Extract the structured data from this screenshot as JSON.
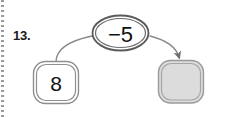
{
  "item": {
    "number_label": "13."
  },
  "diagram": {
    "type": "number-machine-flow",
    "operator_node": {
      "label": "−5",
      "shape": "ellipse",
      "fill": "#ffffff",
      "stroke": "#555555"
    },
    "start_node": {
      "label": "8",
      "shape": "rounded-square",
      "fill": "#ffffff",
      "stroke": "#7a7a7a"
    },
    "answer_node": {
      "label": "",
      "shape": "rounded-square",
      "fill": "#dcdcdc",
      "stroke": "#8a8a8a",
      "is_blank": true
    },
    "connectors": [
      {
        "name": "input-curve",
        "from": "start_node",
        "to": "operator_node",
        "arrowhead": false
      },
      {
        "name": "output-arrow",
        "from": "operator_node",
        "to": "answer_node",
        "arrowhead": true
      }
    ],
    "colors": {
      "ink": "#111111",
      "line": "#6e6e6e",
      "gray_fill": "#dcdcdc",
      "margin_dots": "#9b9b9b",
      "background": "#ffffff"
    }
  }
}
